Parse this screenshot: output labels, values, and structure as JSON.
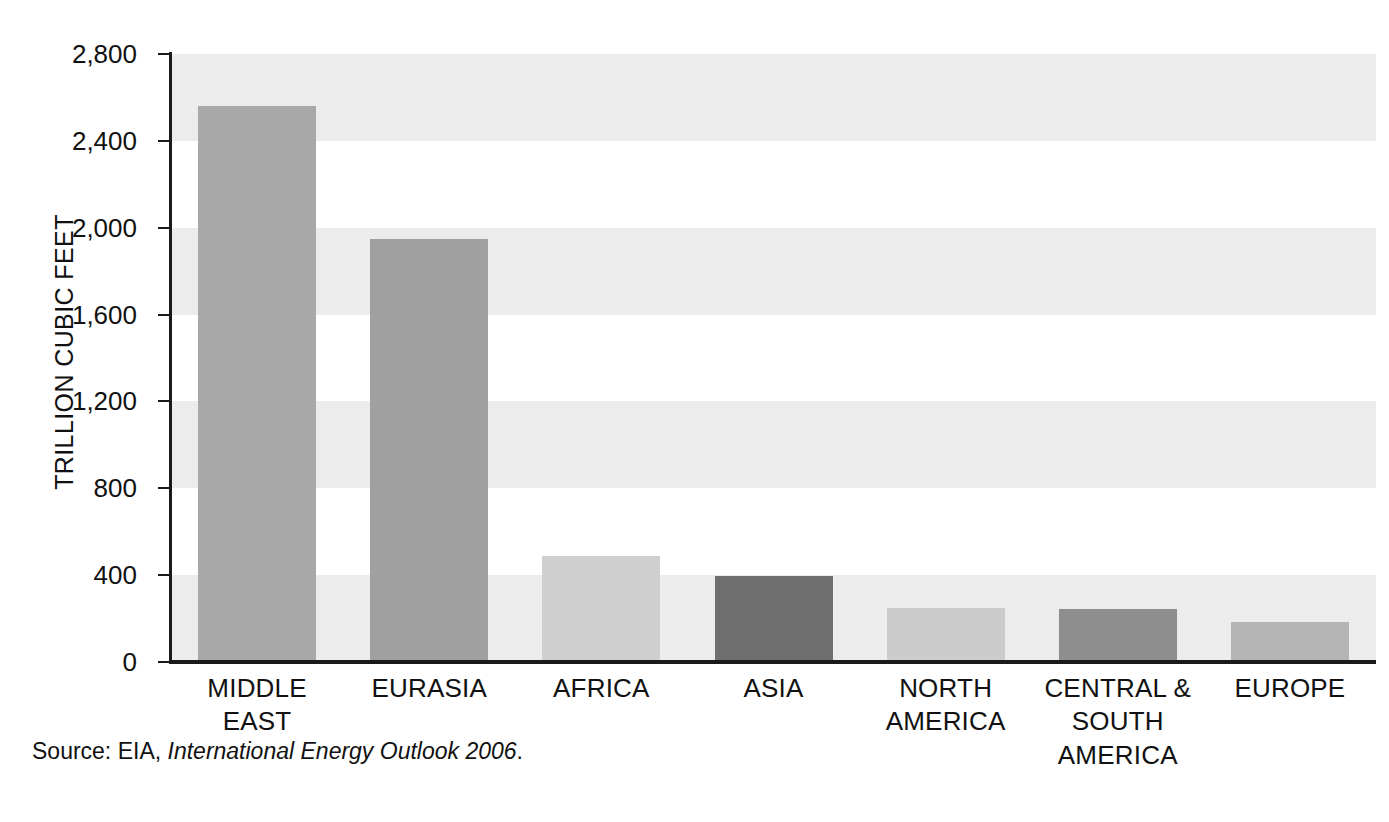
{
  "chart_data": {
    "type": "bar",
    "title": "",
    "xlabel": "",
    "ylabel": "TRILLION CUBIC FEET",
    "ylim": [
      0,
      2800
    ],
    "ytick_interval": 400,
    "yticks": [
      0,
      400,
      800,
      1200,
      1600,
      2000,
      2400,
      2800
    ],
    "ytick_labels": [
      "0",
      "400",
      "800",
      "1,200",
      "1,600",
      "2,000",
      "2,400",
      "2,800"
    ],
    "grid": false,
    "alternating_bands": true,
    "legend": "none",
    "categories": [
      "MIDDLE EAST",
      "EURASIA",
      "AFRICA",
      "ASIA",
      "NORTH AMERICA",
      "CENTRAL & SOUTH AMERICA",
      "EUROPE"
    ],
    "category_lines": [
      [
        "MIDDLE",
        "EAST"
      ],
      [
        "EURASIA"
      ],
      [
        "AFRICA"
      ],
      [
        "ASIA"
      ],
      [
        "NORTH",
        "AMERICA"
      ],
      [
        "CENTRAL &",
        "SOUTH",
        "AMERICA"
      ],
      [
        "EUROPE"
      ]
    ],
    "values": [
      2560,
      1950,
      490,
      395,
      250,
      245,
      185
    ],
    "bar_colors": [
      "#a8a8a8",
      "#a0a0a0",
      "#cfcfcf",
      "#6e6e6e",
      "#cccccc",
      "#8e8e8e",
      "#b4b4b4"
    ]
  },
  "source": {
    "prefix": "Source: EIA,",
    "title": "International Energy Outlook 2006",
    "suffix": "."
  },
  "colors": {
    "band": "#ececec",
    "axis": "#1a1a1a",
    "text": "#111111",
    "background": "#ffffff"
  }
}
